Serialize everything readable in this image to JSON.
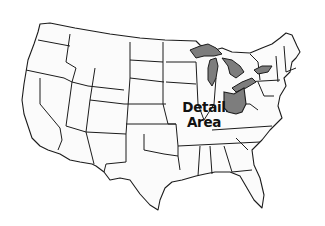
{
  "map": {
    "title": "Contiguous United States",
    "label_line1": "Detail",
    "label_line2": "Area",
    "highlight_color": "#7d7d7d",
    "state_fill": "#fbfbfb",
    "border_color": "#1c1c1c",
    "highlighted_features": [
      "Ohio",
      "Lake Superior",
      "Lake Michigan",
      "Lake Huron",
      "Lake Erie",
      "Lake Ontario"
    ]
  }
}
